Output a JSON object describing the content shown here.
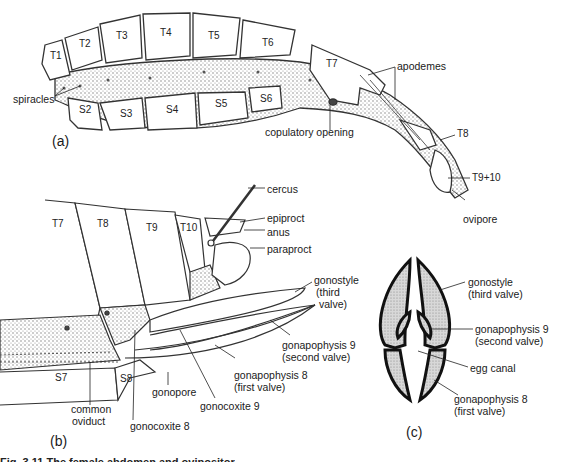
{
  "figure": {
    "caption": "Fig. 3.11 The female abdomen and ovipositor",
    "panels": {
      "a": {
        "label": "(a)",
        "segments": {
          "tergites": [
            "T1",
            "T2",
            "T3",
            "T4",
            "T5",
            "T6",
            "T7",
            "T8",
            "T9+10"
          ],
          "sternites": [
            "S2",
            "S3",
            "S4",
            "S5",
            "S6"
          ]
        },
        "annotations": {
          "spiracles": "spiracles",
          "apodemes": "apodemes",
          "copulatory_opening": "copulatory opening",
          "ovipore": "ovipore"
        }
      },
      "b": {
        "label": "(b)",
        "segments": {
          "tergites": [
            "T7",
            "T8",
            "T9",
            "T10"
          ],
          "sternites": [
            "S7",
            "S8"
          ]
        },
        "annotations": {
          "cercus": "cercus",
          "epiproct": "epiproct",
          "anus": "anus",
          "paraproct": "paraproct",
          "gonostyle": "gonostyle",
          "gonostyle_sub1": "(third",
          "gonostyle_sub2": "valve)",
          "gonapophysis9": "gonapophysis 9",
          "gonapophysis9_sub": "(second valve)",
          "gonapophysis8": "gonapophysis 8",
          "gonapophysis8_sub": "(first valve)",
          "gonopore": "gonopore",
          "gonocoxite9": "gonocoxite 9",
          "common_oviduct_1": "common",
          "common_oviduct_2": "oviduct",
          "gonocoxite8": "gonocoxite 8"
        }
      },
      "c": {
        "label": "(c)",
        "annotations": {
          "gonostyle": "gonostyle",
          "gonostyle_sub": "(third valve)",
          "gonapophysis9": "gonapophysis 9",
          "gonapophysis9_sub": "(second valve)",
          "egg_canal": "egg canal",
          "gonapophysis8": "gonapophysis 8",
          "gonapophysis8_sub": "(first valve)"
        }
      }
    }
  }
}
